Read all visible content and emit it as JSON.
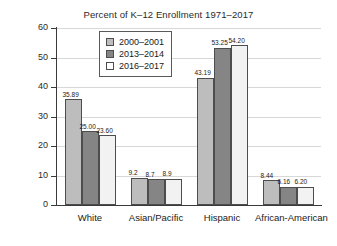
{
  "chart_data": {
    "type": "bar",
    "title": "Percent of K–12 Enrollment 1971–2017",
    "xlabel": "",
    "ylabel": "Percent",
    "ylim": [
      0,
      60
    ],
    "yticks": [
      0,
      10,
      20,
      30,
      40,
      50,
      60
    ],
    "grid": true,
    "legend_position": "top-center",
    "categories": [
      "White",
      "Asian/Pacific",
      "Hispanic",
      "African-American"
    ],
    "series": [
      {
        "name": "2000–2001",
        "color": "#bdbdbd",
        "values": [
          35.89,
          9.2,
          43.19,
          8.44
        ],
        "labels": [
          "35.89",
          "9.2",
          "43.19",
          "8.44"
        ]
      },
      {
        "name": "2013–2014",
        "color": "#858585",
        "values": [
          25.0,
          8.7,
          53.25,
          6.16
        ],
        "labels": [
          "25.00",
          "8.7",
          "53.25",
          "6.16"
        ]
      },
      {
        "name": "2016–2017",
        "color": "#f2f2f2",
        "values": [
          23.6,
          8.9,
          54.2,
          6.2
        ],
        "labels": [
          "23.60",
          "8.9",
          "54.20",
          "6.20"
        ]
      }
    ]
  },
  "axis": {
    "tick_0": "0",
    "tick_10": "10",
    "tick_20": "20",
    "tick_30": "30",
    "tick_40": "40",
    "tick_50": "50",
    "tick_60": "60",
    "y_title": "Percent"
  },
  "legend": {
    "items": [
      {
        "label": "2000–2001"
      },
      {
        "label": "2013–2014"
      },
      {
        "label": "2016–2017"
      }
    ]
  }
}
